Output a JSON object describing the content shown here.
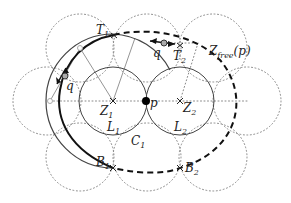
{
  "labels": {
    "T1": "T",
    "T1_sub": "1",
    "T2": "T",
    "T2_sub": "2",
    "q_left": "q",
    "q_top": "q",
    "Z1": "Z",
    "Z1_sub": "1",
    "Z2": "Z",
    "Z2_sub": "2",
    "p": "p",
    "L1": "L",
    "L1_sub": "1",
    "L2": "L",
    "L2_sub": "2",
    "C1": "C",
    "C1_sub": "1",
    "B1": "B",
    "B1_sub": "1",
    "B2": "B",
    "B2_sub": "2",
    "Zfree": "Z",
    "Zfree_sub": "free",
    "Zfree_arg": "(p)"
  },
  "colors": {
    "dotted": "#888888",
    "solid": "#444444",
    "dashed": "#111111",
    "marker": "#aaaaaa"
  }
}
